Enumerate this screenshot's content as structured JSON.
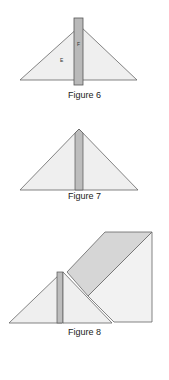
{
  "figures": [
    {
      "caption": "Figure 6",
      "labels": {
        "left": "E",
        "bar": "F"
      }
    },
    {
      "caption": "Figure 7"
    },
    {
      "caption": "Figure 8"
    }
  ],
  "colors": {
    "fill": "#eeeeee",
    "bar": "#b8b8b8",
    "stroke": "#555555",
    "band": "#d6d6d6"
  }
}
